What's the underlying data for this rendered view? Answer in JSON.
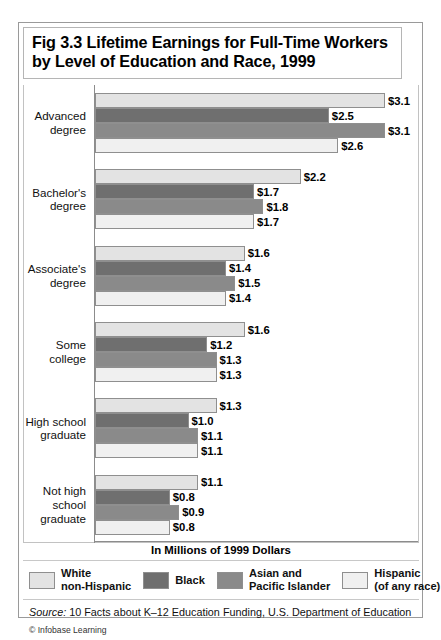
{
  "figure": {
    "title": "Fig 3.3 Lifetime Earnings for Full-Time Workers by Level of Education and Race, 1999",
    "axis_caption": "In Millions of 1999 Dollars",
    "source": "10 Facts about K–12 Education Funding, U.S. Department of Education",
    "source_label": "Source:",
    "copyright": "Infobase Learning",
    "copyright_mark": "©"
  },
  "legend": {
    "items": [
      {
        "label": "White\nnon-Hispanic",
        "color": "#e3e3e3"
      },
      {
        "label": "Black",
        "color": "#6f6f6f"
      },
      {
        "label": "Asian and\nPacific Islander",
        "color": "#8a8a8a"
      },
      {
        "label": "Hispanic\n(of any race)",
        "color": "#f0f0f0"
      }
    ]
  },
  "chart_data": {
    "type": "bar",
    "orientation": "horizontal",
    "title": "Fig 3.3 Lifetime Earnings for Full-Time Workers by Level of Education and Race, 1999",
    "xlabel": "In Millions of 1999 Dollars",
    "ylabel": "",
    "xlim": [
      0,
      3.1
    ],
    "grid": false,
    "legend_position": "bottom",
    "value_prefix": "$",
    "categories": [
      "Advanced degree",
      "Bachelor's degree",
      "Associate's degree",
      "Some college",
      "High school graduate",
      "Not high school graduate"
    ],
    "series": [
      {
        "name": "White non-Hispanic",
        "color": "#e3e3e3",
        "values": [
          3.1,
          2.2,
          1.6,
          1.6,
          1.3,
          1.1
        ],
        "labels": [
          "$3.1",
          "$2.2",
          "$1.6",
          "$1.6",
          "$1.3",
          "$1.1"
        ]
      },
      {
        "name": "Black",
        "color": "#6f6f6f",
        "values": [
          2.5,
          1.7,
          1.4,
          1.2,
          1.0,
          0.8
        ],
        "labels": [
          "$2.5",
          "$1.7",
          "$1.4",
          "$1.2",
          "$1.0",
          "$0.8"
        ]
      },
      {
        "name": "Asian and Pacific Islander",
        "color": "#8a8a8a",
        "values": [
          3.1,
          1.8,
          1.5,
          1.3,
          1.1,
          0.9
        ],
        "labels": [
          "$3.1",
          "$1.8",
          "$1.5",
          "$1.3",
          "$1.1",
          "$0.9"
        ]
      },
      {
        "name": "Hispanic (of any race)",
        "color": "#f0f0f0",
        "values": [
          2.6,
          1.7,
          1.4,
          1.3,
          1.1,
          0.8
        ],
        "labels": [
          "$2.6",
          "$1.7",
          "$1.4",
          "$1.3",
          "$1.1",
          "$0.8"
        ]
      }
    ]
  }
}
